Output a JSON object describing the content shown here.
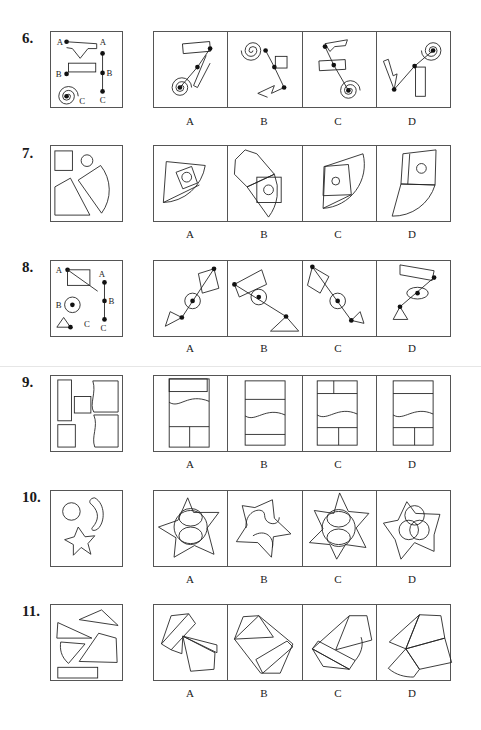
{
  "questions": [
    {
      "number": "6.",
      "ref_labels": {
        "a1": "A",
        "b1": "B",
        "c1": "C",
        "a2": "A",
        "b2": "B",
        "c2": "C"
      },
      "options": [
        "A",
        "B",
        "C",
        "D"
      ]
    },
    {
      "number": "7.",
      "options": [
        "A",
        "B",
        "C",
        "D"
      ]
    },
    {
      "number": "8.",
      "ref_labels": {
        "a1": "A",
        "b1": "B",
        "c1": "C",
        "a2": "A",
        "b2": "B",
        "c2": "C"
      },
      "options": [
        "A",
        "B",
        "C",
        "D"
      ]
    },
    {
      "number": "9.",
      "options": [
        "A",
        "B",
        "C",
        "D"
      ]
    },
    {
      "number": "10.",
      "options": [
        "A",
        "B",
        "C",
        "D"
      ]
    },
    {
      "number": "11.",
      "options": [
        "A",
        "B",
        "C",
        "D"
      ]
    }
  ],
  "colors": {
    "line": "#222222",
    "border": "#555555",
    "background": "#ffffff"
  }
}
